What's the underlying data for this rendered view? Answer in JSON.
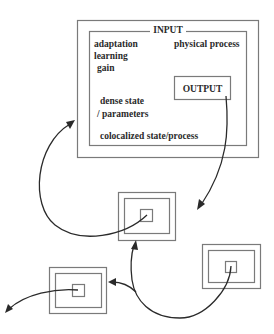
{
  "diagram": {
    "main_block": {
      "title": "INPUT",
      "left_labels": [
        "adaptation",
        "learning",
        "gain"
      ],
      "right_label": "physical process",
      "output_label": "OUTPUT",
      "middle_labels": [
        "dense state",
        "/ parameters"
      ],
      "bottom_label": "colocalized state/process"
    },
    "small_blocks": [
      {
        "name": "middle-block",
        "position": "center"
      },
      {
        "name": "right-block",
        "position": "lower-right"
      },
      {
        "name": "left-block",
        "position": "lower-left"
      }
    ],
    "connections": [
      {
        "from": "OUTPUT",
        "to": "middle-block"
      },
      {
        "from": "middle-block",
        "to": "main-block INPUT"
      },
      {
        "from": "right-block",
        "to": "middle-block"
      },
      {
        "from": "right-block",
        "to": "left-block"
      },
      {
        "from": "left-block",
        "to": "outside"
      }
    ],
    "colors": {
      "box_stroke": "#7a7a7a",
      "arrow": "#2a2a2a",
      "text": "#2a2a2a",
      "background": "#ffffff"
    }
  }
}
